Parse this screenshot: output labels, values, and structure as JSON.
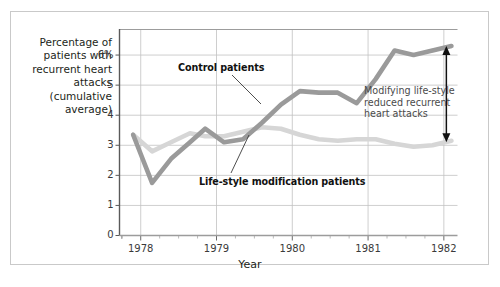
{
  "figure": {
    "y_axis_title": "Percentage of patients with recurrent heart attacks (cumulative average)",
    "x_axis_title": "Year",
    "annotation": "Modifying life-style reduced recurrent heart attacks",
    "series_labels": {
      "control": "Control patients",
      "lifestyle": "Life-style modification patients"
    }
  },
  "chart_data": {
    "type": "line",
    "title": "",
    "xlabel": "Year",
    "ylabel": "Percentage of patients with recurrent heart attacks (cumulative average)",
    "xlim": [
      1977.72,
      1982.18
    ],
    "ylim": [
      0,
      6.85
    ],
    "yticks": [
      0,
      1,
      2,
      3,
      4,
      5,
      6
    ],
    "ytick_labels": [
      "0",
      "1",
      "2",
      "3",
      "4",
      "5",
      "6%"
    ],
    "xticks": [
      1978,
      1979,
      1980,
      1981,
      1982
    ],
    "xtick_labels": [
      "1978",
      "1979",
      "1980",
      "1981",
      "1982"
    ],
    "minor_xticks_per_year": 4,
    "grid": "horizontal and vertical gridlines at major ticks",
    "legend": "inline labels with leader lines",
    "annotations": [
      {
        "text": "Modifying life-style reduced recurrent heart attacks",
        "type": "double-headed-arrow-with-text",
        "at_x": 1982.0,
        "from_y": 3.1,
        "to_y": 6.3
      }
    ],
    "series": [
      {
        "name": "Control patients",
        "color": "#9a9a9a",
        "x": [
          1977.9,
          1978.15,
          1978.4,
          1978.65,
          1978.85,
          1979.1,
          1979.35,
          1979.6,
          1979.85,
          1980.1,
          1980.35,
          1980.6,
          1980.85,
          1981.1,
          1981.35,
          1981.6,
          1981.85,
          1982.1
        ],
        "values": [
          3.35,
          1.75,
          2.55,
          3.1,
          3.55,
          3.1,
          3.2,
          3.75,
          4.35,
          4.8,
          4.75,
          4.75,
          4.4,
          5.2,
          6.15,
          6.0,
          6.15,
          6.3
        ]
      },
      {
        "name": "Life-style modification patients",
        "color": "#d6d6d6",
        "x": [
          1977.9,
          1978.15,
          1978.4,
          1978.65,
          1978.85,
          1979.1,
          1979.35,
          1979.6,
          1979.85,
          1980.1,
          1980.35,
          1980.6,
          1980.85,
          1981.1,
          1981.35,
          1981.6,
          1981.85,
          1982.1
        ],
        "values": [
          3.35,
          2.8,
          3.1,
          3.4,
          3.3,
          3.3,
          3.45,
          3.6,
          3.55,
          3.35,
          3.2,
          3.15,
          3.2,
          3.2,
          3.05,
          2.95,
          3.0,
          3.15
        ]
      }
    ]
  }
}
